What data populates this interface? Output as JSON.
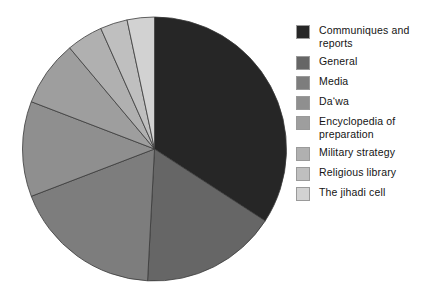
{
  "chart_data": {
    "type": "pie",
    "title": "",
    "subtitle": "",
    "xlabel": "",
    "ylabel": "",
    "grid": false,
    "legend_position": "right",
    "start_angle_deg": 0,
    "direction": "clockwise",
    "categories": [
      "Communiques and reports",
      "General",
      "Media",
      "Da‘wa",
      "Encyclopedia of preparation",
      "Military strategy",
      "Religious library",
      "The jihadi cell"
    ],
    "values": [
      34.2,
      16.7,
      18.3,
      11.7,
      8.1,
      4.4,
      3.3,
      3.3
    ],
    "units": "percent",
    "slice_angles_deg": [
      123.0,
      60.0,
      66.0,
      42.0,
      29.0,
      16.0,
      12.0,
      12.0
    ],
    "colors": [
      "#262626",
      "#666666",
      "#7d7d7d",
      "#8f8f8f",
      "#9e9e9e",
      "#b0b0b0",
      "#bfbfbf",
      "#d2d2d2"
    ],
    "slice_border_color": "#3a3a3a",
    "background": "#ffffff"
  },
  "legend": {
    "items": [
      {
        "label": "Communiques and reports",
        "color": "#262626"
      },
      {
        "label": "General",
        "color": "#666666"
      },
      {
        "label": "Media",
        "color": "#7d7d7d"
      },
      {
        "label": "Da‘wa",
        "color": "#8f8f8f"
      },
      {
        "label": "Encyclopedia of preparation",
        "color": "#9e9e9e"
      },
      {
        "label": "Military strategy",
        "color": "#b0b0b0"
      },
      {
        "label": "Religious library",
        "color": "#bfbfbf"
      },
      {
        "label": "The jihadi cell",
        "color": "#d2d2d2"
      }
    ]
  },
  "geometry": {
    "center_x": 154.5,
    "center_y": 149,
    "radius": 132
  }
}
